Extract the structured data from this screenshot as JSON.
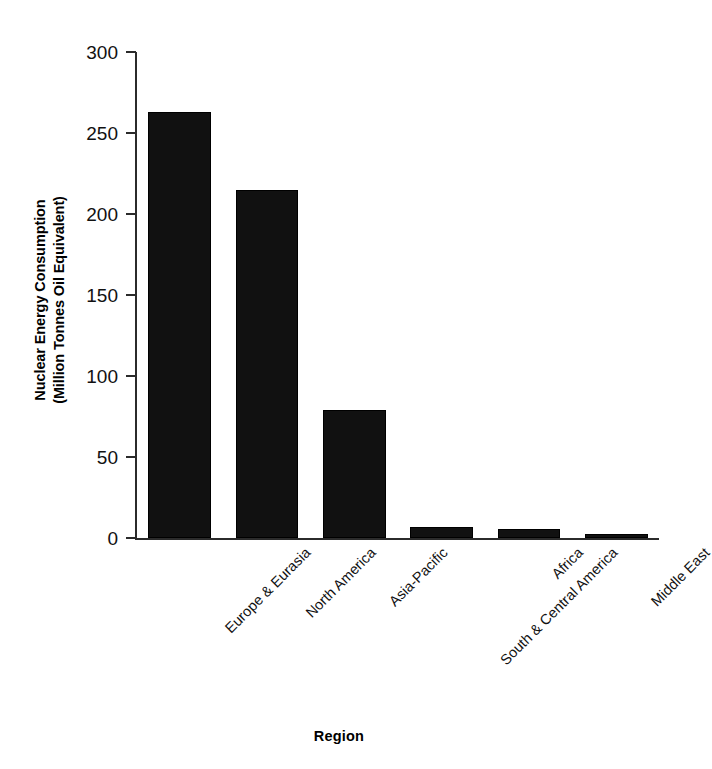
{
  "chart_data": {
    "type": "bar",
    "title": "",
    "xlabel": "Region",
    "ylabel": "Nuclear Energy Consumption (Million Tonnes Oil Equivalent)",
    "ylabel_lines": [
      "Nuclear Energy Consumption",
      "(Million Tonnes Oil Equivalent)"
    ],
    "categories": [
      "Europe & Eurasia",
      "North America",
      "Asia-Pacific",
      "South & Central America",
      "Africa",
      "Middle East"
    ],
    "values": [
      263,
      215,
      79,
      7,
      5.5,
      2.5
    ],
    "ylim": [
      0,
      300
    ],
    "yticks": [
      0,
      50,
      100,
      150,
      200,
      250,
      300
    ],
    "ytick_labels": [
      "0",
      "50",
      "100",
      "150",
      "200",
      "250",
      "300"
    ],
    "grid": false,
    "legend": "none",
    "bar_color": "#111111",
    "axis_color": "#2b2b2b",
    "background": "#ffffff"
  }
}
